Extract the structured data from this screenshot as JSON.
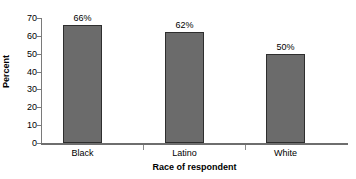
{
  "chart_data": {
    "type": "bar",
    "title": "",
    "categories": [
      "Black",
      "Latino",
      "White"
    ],
    "values": [
      66,
      62,
      50
    ],
    "value_labels": [
      "66%",
      "62%",
      "50%"
    ],
    "xlabel": "Race of respondent",
    "ylabel": "Percent",
    "ylim": [
      0,
      70
    ],
    "yticks": [
      0,
      10,
      20,
      30,
      40,
      50,
      60,
      70
    ],
    "ytick_labels": [
      "0",
      "10",
      "20",
      "30",
      "40",
      "50",
      "60",
      "70"
    ],
    "grid": false,
    "legend": false,
    "bar_color": "#6b6b6b",
    "bar_border_color": "#2e2e2e",
    "axis_color": "#6e6e6e",
    "background": "#ffffff"
  }
}
